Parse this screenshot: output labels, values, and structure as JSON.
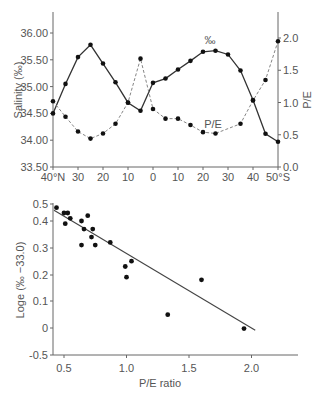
{
  "chart_data": [
    {
      "type": "line",
      "title": "",
      "xlabel": "",
      "x_tick_labels": [
        "40°N",
        "30",
        "20",
        "10",
        "0",
        "10",
        "20",
        "30",
        "40",
        "50°S"
      ],
      "x": [
        40,
        35,
        30,
        25,
        20,
        15,
        10,
        5,
        0,
        -5,
        -10,
        -15,
        -20,
        -25,
        -30,
        -35,
        -40,
        -45,
        -50
      ],
      "ylabel": "Salinity (‰)",
      "ylabel_right": "P/E",
      "y_tick_labels": [
        "33.50",
        "34.00",
        "34.50",
        "35.00",
        "35.50",
        "36.00"
      ],
      "y_right_tick_labels": [
        "0.0",
        "0.5",
        "1.0",
        "1.5",
        "2.0"
      ],
      "ylim": [
        33.5,
        36.25
      ],
      "ylim_right": [
        0.0,
        2.2
      ],
      "series": [
        {
          "name": "‰",
          "axis": "left",
          "style": "solid",
          "values": [
            34.5,
            35.05,
            35.55,
            35.78,
            35.43,
            35.08,
            34.7,
            34.55,
            35.07,
            35.15,
            35.32,
            35.48,
            35.65,
            35.67,
            35.6,
            35.3,
            34.75,
            34.12,
            33.97
          ]
        },
        {
          "name": "P/E",
          "axis": "right",
          "style": "dashed",
          "values": [
            1.02,
            0.78,
            0.55,
            0.44,
            0.52,
            0.67,
            1.0,
            1.68,
            0.9,
            0.75,
            0.75,
            0.65,
            0.54,
            0.52,
            null,
            0.67,
            1.03,
            1.35,
            1.95
          ]
        }
      ],
      "annotations": [
        "‰",
        "P/E"
      ]
    },
    {
      "type": "scatter",
      "title": "",
      "xlabel": "P/E ratio",
      "ylabel": "Loge (‰ −33.0)",
      "x_tick_labels": [
        "0.5",
        "1.0",
        "1.5",
        "2.0"
      ],
      "y_tick_labels": [
        "-0.5",
        "0",
        "0.1",
        "0.2",
        "0.3",
        "0.4",
        "0.5"
      ],
      "points": [
        [
          0.44,
          0.45
        ],
        [
          0.5,
          0.43
        ],
        [
          0.53,
          0.43
        ],
        [
          0.51,
          0.39
        ],
        [
          0.55,
          0.41
        ],
        [
          0.64,
          0.4
        ],
        [
          0.69,
          0.42
        ],
        [
          0.66,
          0.37
        ],
        [
          0.73,
          0.37
        ],
        [
          0.72,
          0.34
        ],
        [
          0.64,
          0.31
        ],
        [
          0.75,
          0.31
        ],
        [
          0.87,
          0.32
        ],
        [
          0.99,
          0.23
        ],
        [
          1.04,
          0.25
        ],
        [
          1.0,
          0.19
        ],
        [
          1.33,
          0.05
        ],
        [
          1.6,
          0.18
        ],
        [
          1.94,
          -0.01
        ]
      ],
      "trendline": {
        "x": [
          0.42,
          2.03
        ],
        "y": [
          0.44,
          -0.04
        ]
      }
    }
  ]
}
